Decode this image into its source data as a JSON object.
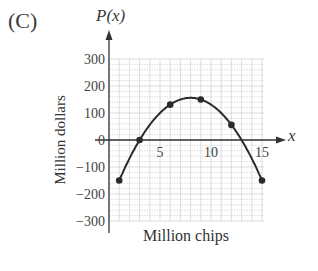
{
  "panel": {
    "label": "(C)"
  },
  "chart_data": {
    "type": "line",
    "title": "(C)",
    "function_label": "P(x)",
    "x_variable": "x",
    "xlabel": "Million chips",
    "ylabel": "Million dollars",
    "x": [
      1,
      3,
      6,
      9,
      12,
      15
    ],
    "series": [
      {
        "name": "P(x)",
        "values": [
          -150,
          0,
          131,
          150,
          56,
          -150
        ],
        "marker": "circle",
        "curve": "smooth quadratic"
      }
    ],
    "xlim": [
      0,
      15
    ],
    "ylim": [
      -300,
      300
    ],
    "x_ticks": [
      5,
      10,
      15
    ],
    "y_ticks": [
      300,
      200,
      100,
      0,
      -100,
      -200,
      -300
    ],
    "x_tick_labels": [
      "5",
      "10",
      "15"
    ],
    "y_tick_labels": [
      "300",
      "200",
      "100",
      "0",
      "−100",
      "−200",
      "−300"
    ],
    "grid": true,
    "legend": null
  },
  "colors": {
    "curve": "#2a2a2a",
    "grid": "#c8c8c8",
    "axis": "#333333"
  }
}
